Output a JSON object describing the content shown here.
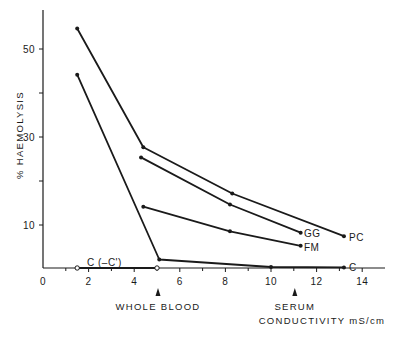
{
  "chart_data": {
    "type": "line",
    "title": "",
    "xlabel": "CONDUCTIVITY mS/cm",
    "ylabel": "% HAEMOLYSIS",
    "xlim": [
      0,
      15
    ],
    "ylim": [
      0,
      58
    ],
    "x_ticks": [
      0,
      2,
      4,
      6,
      8,
      10,
      12,
      14
    ],
    "x_minor_ticks": [
      1,
      3,
      5,
      7,
      9,
      11,
      13
    ],
    "y_ticks_labeled": [
      10,
      30,
      50
    ],
    "y_ticks_unlabeled": [
      20,
      40
    ],
    "grid": false,
    "legend": "inline labels at series end",
    "series": [
      {
        "name": "PC",
        "marker": "filled",
        "x": [
          1.5,
          4.4,
          8.3,
          13.2
        ],
        "y": [
          55,
          28,
          17.5,
          7.8
        ]
      },
      {
        "name": "GG",
        "marker": "filled",
        "x": [
          4.3,
          8.2,
          11.3
        ],
        "y": [
          25.7,
          15,
          8.6
        ]
      },
      {
        "name": "FM",
        "marker": "filled",
        "x": [
          4.4,
          8.2,
          11.3
        ],
        "y": [
          14.5,
          8.9,
          5.6
        ]
      },
      {
        "name": "C",
        "marker": "filled",
        "x": [
          1.5,
          5.1,
          10.0,
          13.2
        ],
        "y": [
          44.5,
          2.5,
          0.8,
          0.7
        ]
      },
      {
        "name": "C (-C')",
        "marker": "open",
        "x": [
          1.5,
          5.0
        ],
        "y": [
          0.2,
          0.2
        ]
      }
    ],
    "annotations": [
      {
        "text": "WHOLE BLOOD",
        "x": 5.0,
        "marker": "arrow-up"
      },
      {
        "text": "SERUM",
        "x": 11.0,
        "marker": "arrow-up"
      }
    ]
  },
  "labels": {
    "ylabel": "% HAEMOLYSIS",
    "xlabel": "CONDUCTIVITY mS/cm",
    "whole_blood": "WHOLE BLOOD",
    "serum": "SERUM",
    "pc": "PC",
    "gg": "GG",
    "fm": "FM",
    "c": "C",
    "c_minus": "C (–C')"
  }
}
